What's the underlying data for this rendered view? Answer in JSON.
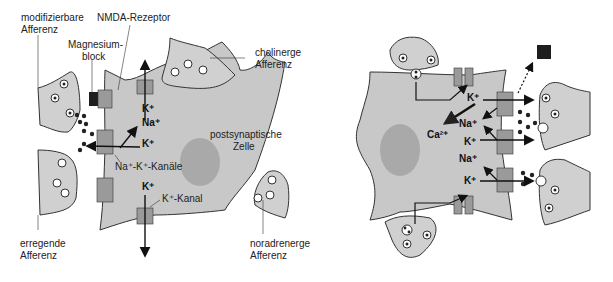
{
  "colors": {
    "cell_fill": "#c8c8c8",
    "nucleus_fill": "#a9a9a9",
    "channel_fill": "#9a9a9a",
    "terminal_fill": "#d0d0d0",
    "magnesium_block": "#1e1e1e",
    "ion_dot": "#222222",
    "stroke": "#333333"
  },
  "left_panel": {
    "labels": {
      "modifiable_afferent": [
        "modifizierbare",
        "Afferenz"
      ],
      "nmda_receptor": "NMDA-Rezeptor",
      "magnesium_block": [
        "Magnesium-",
        "block"
      ],
      "cholinergic_afferent": [
        "cholinerge",
        "Afferenz"
      ],
      "postsynaptic_cell": [
        "postsynaptische",
        "Zelle"
      ],
      "na_k_channels": "Na⁺-K⁺-Kanäle",
      "k_channel": "K⁺-Kanal",
      "excitatory_afferent": [
        "erregende",
        "Afferenz"
      ],
      "noradrenergic_afferent": [
        "noradrenerge",
        "Afferenz"
      ]
    },
    "ions": {
      "k_top": "K⁺",
      "na_mid": "Na⁺",
      "k_mid": "K⁺",
      "k_bottom": "K⁺"
    }
  },
  "right_panel": {
    "ions": {
      "k1": "K⁺",
      "ca": "Ca²⁺",
      "na1": "Na⁺",
      "k2": "K⁺",
      "na2": "Na⁺",
      "k3": "K⁺"
    }
  }
}
